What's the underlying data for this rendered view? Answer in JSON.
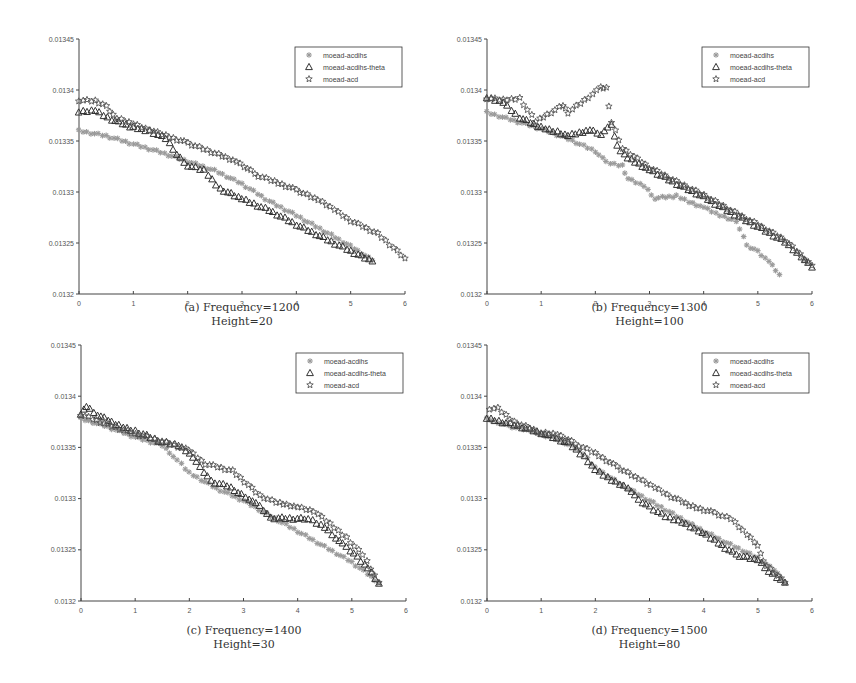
{
  "figure": {
    "background": "#ffffff",
    "axis_color": "#444444",
    "series_styles": [
      {
        "name": "moead-acdihs",
        "marker": "asterisk",
        "color": "#9a9a9a"
      },
      {
        "name": "moead-acdihs-theta",
        "marker": "triangle",
        "color": "#333333"
      },
      {
        "name": "moead-acd",
        "marker": "star",
        "color": "#555555"
      }
    ]
  },
  "panels": [
    {
      "id": "a",
      "caption_line1": "(a) Frequency=1200",
      "caption_line2": "Height=20"
    },
    {
      "id": "b",
      "caption_line1": "(b) Frequency=1300",
      "caption_line2": "Height=100"
    },
    {
      "id": "c",
      "caption_line1": "(c) Frequency=1400",
      "caption_line2": "Height=30"
    },
    {
      "id": "d",
      "caption_line1": "(d) Frequency=1500",
      "caption_line2": "Height=80"
    }
  ],
  "chart_data": [
    {
      "type": "scatter",
      "title": "(a) Frequency=1200, Height=20",
      "xlabel": "",
      "ylabel": "",
      "xlim": [
        0,
        6
      ],
      "ylim": [
        0.0132,
        0.01345
      ],
      "xticks": [
        0,
        1,
        2,
        3,
        4,
        5,
        6
      ],
      "yticks": [
        "0.0132",
        "0.01325",
        "0.0133",
        "0.01335",
        "0.0134",
        "0.01345"
      ],
      "grid": false,
      "legend_position": "upper right",
      "series": [
        {
          "name": "moead-acdihs",
          "x": [
            0,
            0.5,
            1,
            1.5,
            2,
            2.5,
            3,
            3.5,
            4,
            4.5,
            5,
            5.4
          ],
          "y": [
            0.01336,
            0.013355,
            0.013347,
            0.013339,
            0.01333,
            0.013321,
            0.013308,
            0.013291,
            0.013277,
            0.013262,
            0.013247,
            0.013233
          ]
        },
        {
          "name": "moead-acdihs-theta",
          "x": [
            0,
            0.3,
            0.6,
            1,
            1.3,
            1.6,
            1.8,
            2,
            2.3,
            2.6,
            3,
            3.5,
            4,
            4.5,
            5,
            5.4
          ],
          "y": [
            0.013378,
            0.01338,
            0.013371,
            0.013363,
            0.01336,
            0.013352,
            0.013337,
            0.013326,
            0.013321,
            0.013303,
            0.013293,
            0.013282,
            0.013268,
            0.013255,
            0.013242,
            0.013232
          ]
        },
        {
          "name": "moead-acd",
          "x": [
            0,
            0.3,
            0.5,
            0.7,
            1,
            1.3,
            1.6,
            2,
            2.5,
            2.9,
            3.3,
            3.6,
            4,
            4.4,
            4.7,
            5,
            5.5,
            6
          ],
          "y": [
            0.01339,
            0.013389,
            0.013384,
            0.013372,
            0.013367,
            0.013361,
            0.013355,
            0.013348,
            0.013338,
            0.01333,
            0.013316,
            0.01331,
            0.013302,
            0.013292,
            0.013283,
            0.013272,
            0.013259,
            0.013235
          ]
        }
      ]
    },
    {
      "type": "scatter",
      "title": "(b) Frequency=1300, Height=100",
      "xlabel": "",
      "ylabel": "",
      "xlim": [
        0,
        6
      ],
      "ylim": [
        0.0132,
        0.01345
      ],
      "xticks": [
        0,
        1,
        2,
        3,
        4,
        5,
        6
      ],
      "yticks": [
        "0.0132",
        "0.01325",
        "0.0133",
        "0.01335",
        "0.0134",
        "0.01345"
      ],
      "grid": false,
      "legend_position": "upper right",
      "series": [
        {
          "name": "moead-acdihs",
          "x": [
            0,
            0.5,
            1,
            1.5,
            2,
            2.2,
            2.5,
            2.6,
            2.9,
            3.1,
            3.5,
            3.8,
            4,
            4.3,
            4.6,
            4.8,
            5,
            5.2,
            5.4
          ],
          "y": [
            0.013378,
            0.01337,
            0.013362,
            0.013352,
            0.01334,
            0.013329,
            0.013326,
            0.013313,
            0.013306,
            0.013294,
            0.013296,
            0.013289,
            0.013285,
            0.013277,
            0.013272,
            0.013247,
            0.013242,
            0.013232,
            0.013219
          ]
        },
        {
          "name": "moead-acdihs-theta",
          "x": [
            0,
            0.3,
            0.6,
            1,
            1.3,
            1.5,
            1.9,
            2.1,
            2.3,
            2.4,
            2.6,
            3,
            3.5,
            4,
            4.5,
            5,
            5.5,
            5.8,
            6
          ],
          "y": [
            0.013392,
            0.013388,
            0.013373,
            0.013363,
            0.013359,
            0.013355,
            0.013361,
            0.013357,
            0.013365,
            0.013345,
            0.013333,
            0.013322,
            0.013308,
            0.013295,
            0.01328,
            0.013266,
            0.013251,
            0.013237,
            0.013226
          ]
        },
        {
          "name": "moead-acd",
          "x": [
            0,
            0.3,
            0.6,
            0.9,
            1.4,
            1.5,
            2.1,
            2.2,
            2.3,
            2.5,
            3,
            3.5,
            4,
            4.5,
            5,
            5.5,
            6
          ],
          "y": [
            0.013392,
            0.01339,
            0.013392,
            0.013369,
            0.013385,
            0.013378,
            0.013402,
            0.013402,
            0.013368,
            0.013343,
            0.013324,
            0.01331,
            0.013297,
            0.013282,
            0.013268,
            0.013253,
            0.013228
          ]
        }
      ]
    },
    {
      "type": "scatter",
      "title": "(c) Frequency=1400, Height=30",
      "xlabel": "",
      "ylabel": "",
      "xlim": [
        0,
        6
      ],
      "ylim": [
        0.0132,
        0.01345
      ],
      "xticks": [
        0,
        1,
        2,
        3,
        4,
        5,
        6
      ],
      "yticks": [
        "0.0132",
        "0.01325",
        "0.0133",
        "0.01335",
        "0.0134",
        "0.01345"
      ],
      "grid": false,
      "legend_position": "upper right",
      "series": [
        {
          "name": "moead-acdihs",
          "x": [
            0,
            0.5,
            1,
            1.5,
            1.7,
            2,
            2.5,
            3,
            3.5,
            4,
            4.5,
            5,
            5.5
          ],
          "y": [
            0.013378,
            0.01337,
            0.01336,
            0.013352,
            0.013342,
            0.013325,
            0.01331,
            0.013298,
            0.013283,
            0.013268,
            0.013253,
            0.013238,
            0.013218
          ]
        },
        {
          "name": "moead-acdihs-theta",
          "x": [
            0,
            0.1,
            0.3,
            0.7,
            1,
            1.5,
            1.8,
            2,
            2.2,
            2.4,
            2.7,
            2.9,
            3.1,
            3.3,
            3.5,
            4.2,
            4.5,
            4.7,
            4.9,
            5.1,
            5.3,
            5.5
          ],
          "y": [
            0.013382,
            0.01339,
            0.013382,
            0.013371,
            0.013366,
            0.013355,
            0.013352,
            0.013345,
            0.01333,
            0.013317,
            0.013312,
            0.013306,
            0.0133,
            0.013292,
            0.013281,
            0.01328,
            0.013272,
            0.013262,
            0.013252,
            0.013243,
            0.013232,
            0.013217
          ]
        },
        {
          "name": "moead-acd",
          "x": [
            0,
            0.5,
            1,
            1.5,
            2,
            2.3,
            2.8,
            3.3,
            3.6,
            4,
            4.3,
            4.6,
            4.9,
            5.2,
            5.5
          ],
          "y": [
            0.013382,
            0.013372,
            0.013363,
            0.013356,
            0.013347,
            0.013334,
            0.013327,
            0.013303,
            0.013296,
            0.013292,
            0.013288,
            0.013275,
            0.013262,
            0.013245,
            0.013218
          ]
        }
      ]
    },
    {
      "type": "scatter",
      "title": "(d) Frequency=1500, Height=80",
      "xlabel": "",
      "ylabel": "",
      "xlim": [
        0,
        6
      ],
      "ylim": [
        0.0132,
        0.01345
      ],
      "xticks": [
        0,
        1,
        2,
        3,
        4,
        5,
        6
      ],
      "yticks": [
        "0.0132",
        "0.01325",
        "0.0133",
        "0.01335",
        "0.0134",
        "0.01345"
      ],
      "grid": false,
      "legend_position": "upper right",
      "series": [
        {
          "name": "moead-acdihs",
          "x": [
            0,
            0.4,
            0.8,
            1.3,
            1.7,
            2,
            2.5,
            3,
            3.5,
            4,
            4.5,
            5,
            5.3,
            5.5
          ],
          "y": [
            0.013378,
            0.013371,
            0.013366,
            0.013358,
            0.013348,
            0.01333,
            0.013313,
            0.013298,
            0.013283,
            0.013268,
            0.013255,
            0.013242,
            0.01323,
            0.013218
          ]
        },
        {
          "name": "moead-acdihs-theta",
          "x": [
            0,
            0.5,
            1,
            1.5,
            1.8,
            2,
            2.3,
            2.6,
            2.8,
            3,
            3.3,
            3.6,
            3.9,
            4.2,
            4.6,
            5,
            5.2,
            5.5
          ],
          "y": [
            0.013378,
            0.013372,
            0.013364,
            0.013354,
            0.013341,
            0.013328,
            0.013318,
            0.013311,
            0.013298,
            0.013292,
            0.013282,
            0.013277,
            0.013269,
            0.013259,
            0.013245,
            0.01324,
            0.013229,
            0.013218
          ]
        },
        {
          "name": "moead-acd",
          "x": [
            0.05,
            0.2,
            0.5,
            1,
            1.3,
            1.7,
            2,
            2.4,
            2.8,
            3.1,
            3.4,
            3.8,
            4.2,
            4.5,
            4.8,
            5.0,
            5.1,
            5.5
          ],
          "y": [
            0.013388,
            0.013388,
            0.013375,
            0.013364,
            0.013363,
            0.013352,
            0.013344,
            0.013331,
            0.013319,
            0.013311,
            0.013302,
            0.013292,
            0.013286,
            0.01328,
            0.013265,
            0.013255,
            0.013238,
            0.013218
          ]
        }
      ]
    }
  ]
}
